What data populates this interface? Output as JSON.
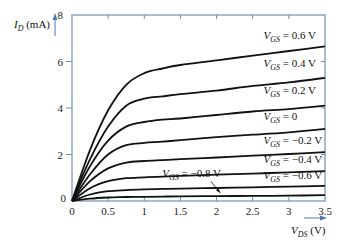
{
  "chart_data": {
    "type": "line",
    "title": "",
    "xlabel": "V_DS (V)",
    "ylabel": "I_D (mA)",
    "xlim": [
      0,
      3.5
    ],
    "ylim": [
      0,
      8
    ],
    "x_ticks": [
      "0",
      "0.5",
      "1",
      "1.5",
      "2",
      "2.5",
      "3",
      "3.5"
    ],
    "y_ticks": [
      "0",
      "2",
      "4",
      "6",
      "8"
    ],
    "grid": false,
    "x": [
      0,
      0.25,
      0.5,
      0.75,
      1.0,
      1.25,
      1.5,
      2.0,
      2.5,
      3.0,
      3.5
    ],
    "series": [
      {
        "name": "V_GS = 0.6 V",
        "label": "0.6 V",
        "values": [
          0,
          2.2,
          3.9,
          5.0,
          5.5,
          5.7,
          5.85,
          6.05,
          6.25,
          6.45,
          6.65
        ]
      },
      {
        "name": "V_GS = 0.4 V",
        "label": "0.4 V",
        "values": [
          0,
          1.8,
          3.2,
          4.1,
          4.4,
          4.5,
          4.6,
          4.75,
          4.95,
          5.1,
          5.3
        ]
      },
      {
        "name": "V_GS = 0.2 V",
        "label": "0.2 V",
        "values": [
          0,
          1.5,
          2.6,
          3.2,
          3.4,
          3.5,
          3.55,
          3.7,
          3.85,
          3.95,
          4.1
        ]
      },
      {
        "name": "V_GS = 0",
        "label": "0",
        "values": [
          0,
          1.15,
          2.0,
          2.4,
          2.5,
          2.55,
          2.62,
          2.75,
          2.85,
          2.95,
          3.1
        ]
      },
      {
        "name": "V_GS = -0.2 V",
        "label": "−0.2 V",
        "values": [
          0,
          0.85,
          1.4,
          1.65,
          1.72,
          1.76,
          1.8,
          1.87,
          1.95,
          2.02,
          2.1
        ]
      },
      {
        "name": "V_GS = -0.4 V",
        "label": "−0.4 V",
        "values": [
          0,
          0.55,
          0.85,
          0.98,
          1.02,
          1.05,
          1.08,
          1.13,
          1.18,
          1.23,
          1.28
        ]
      },
      {
        "name": "V_GS = -0.6 V",
        "label": "−0.6 V",
        "values": [
          0,
          0.28,
          0.42,
          0.47,
          0.5,
          0.52,
          0.53,
          0.56,
          0.59,
          0.62,
          0.65
        ]
      },
      {
        "name": "V_GS = -0.8 V",
        "label": "−0.8 V",
        "values": [
          0,
          0.1,
          0.15,
          0.17,
          0.18,
          0.19,
          0.2,
          0.21,
          0.22,
          0.23,
          0.25
        ]
      }
    ],
    "annotations": [
      {
        "text": "V_GS = 0.6 V",
        "x": 2.65,
        "y": 6.95
      },
      {
        "text": "V_GS = 0.4 V",
        "x": 2.65,
        "y": 5.75
      },
      {
        "text": "V_GS = 0.2 V",
        "x": 2.65,
        "y": 4.6
      },
      {
        "text": "V_GS = 0",
        "x": 2.65,
        "y": 3.5
      },
      {
        "text": "V_GS = -0.2 V",
        "x": 2.65,
        "y": 2.45
      },
      {
        "text": "V_GS = -0.4 V",
        "x": 2.65,
        "y": 1.65
      },
      {
        "text": "V_GS = -0.6 V",
        "x": 2.65,
        "y": 0.95
      },
      {
        "text": "V_GS = -0.8 V",
        "x": 1.25,
        "y": 1.05,
        "arrow_to": [
          2.05,
          0.22
        ]
      }
    ]
  },
  "labels": {
    "y_axis_main": "I",
    "y_axis_sub": "D",
    "y_axis_unit": " (mA)",
    "x_axis_main": "V",
    "x_axis_sub": "DS",
    "x_axis_unit": " (V)",
    "vgs_main": "V",
    "vgs_sub": "GS"
  },
  "colors": {
    "frame": "#6f8fb0",
    "curve": "#111111",
    "arrow": "#4a79a8",
    "text": "#222222"
  }
}
